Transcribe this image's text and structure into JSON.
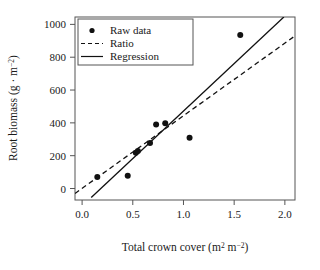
{
  "chart_data": {
    "type": "scatter",
    "title": "",
    "xlabel": "Total crown cover (m2 m-2)",
    "xlabel_parts": {
      "main": "Total crown cover (m",
      "sup1": "2",
      "mid": " m",
      "sup2": "−2",
      "tail": ")"
    },
    "ylabel": "Root biomass (g · m-2)",
    "ylabel_parts": {
      "main": "Root biomass (g · m",
      "sup": "−2",
      "tail": ")"
    },
    "xlim": [
      -0.07,
      2.1
    ],
    "ylim": [
      -70,
      1045
    ],
    "xticks": [
      0.0,
      0.5,
      1.0,
      1.5,
      2.0
    ],
    "xticklabels": [
      "0.0",
      "0.5",
      "1.0",
      "1.5",
      "2.0"
    ],
    "yticks": [
      0,
      200,
      400,
      600,
      800,
      1000
    ],
    "yticklabels": [
      "0",
      "200",
      "400",
      "600",
      "800",
      "1000"
    ],
    "grid": false,
    "legend_position": "upper-left",
    "series": [
      {
        "name": "Raw data",
        "type": "scatter",
        "marker": "circle",
        "color": "#111111",
        "points": [
          {
            "x": 0.15,
            "y": 70
          },
          {
            "x": 0.45,
            "y": 78
          },
          {
            "x": 0.53,
            "y": 218
          },
          {
            "x": 0.55,
            "y": 228
          },
          {
            "x": 0.67,
            "y": 278
          },
          {
            "x": 0.73,
            "y": 390
          },
          {
            "x": 0.82,
            "y": 398
          },
          {
            "x": 1.06,
            "y": 310
          },
          {
            "x": 1.56,
            "y": 935
          }
        ]
      },
      {
        "name": "Ratio",
        "type": "line",
        "style": "dashed",
        "color": "#111111",
        "x": [
          -0.07,
          2.1
        ],
        "y": [
          -30,
          930
        ]
      },
      {
        "name": "Regression",
        "type": "line",
        "style": "solid",
        "color": "#111111",
        "x": [
          0.09,
          1.99
        ],
        "y": [
          -55,
          1045
        ]
      }
    ]
  },
  "legend": {
    "entries": [
      {
        "label": "Raw data",
        "marker": "circle"
      },
      {
        "label": "Ratio",
        "marker": "dashed-line"
      },
      {
        "label": "Regression",
        "marker": "solid-line"
      }
    ]
  }
}
